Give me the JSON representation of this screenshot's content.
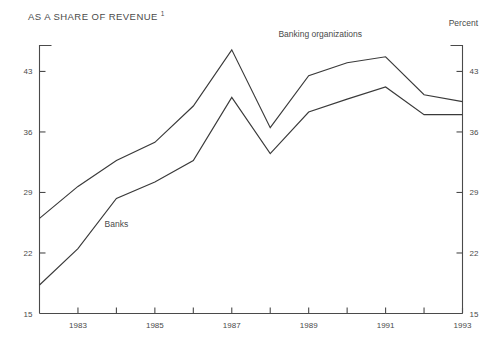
{
  "header": {
    "title": "AS A SHARE OF REVENUE",
    "title_footnote": "1",
    "unit_label": "Percent"
  },
  "chart_data": {
    "type": "line",
    "title": "AS A SHARE OF REVENUE",
    "subtitle": "",
    "xlabel": "",
    "ylabel": "Percent",
    "xlim": [
      1982,
      1993
    ],
    "ylim": [
      15,
      46
    ],
    "grid": false,
    "legend": "inline-annotations",
    "y_ticks": [
      15,
      22,
      29,
      36,
      43
    ],
    "x_ticks": [
      1982,
      1983,
      1984,
      1985,
      1986,
      1987,
      1988,
      1989,
      1990,
      1991,
      1992,
      1993
    ],
    "x_tick_labels": [
      "",
      "1983",
      "",
      "1985",
      "",
      "1987",
      "",
      "1989",
      "",
      "1991",
      "",
      "1993"
    ],
    "x": [
      1982,
      1983,
      1984,
      1985,
      1986,
      1987,
      1988,
      1989,
      1990,
      1991,
      1992,
      1993
    ],
    "series": [
      {
        "name": "Banking organizations",
        "values": [
          26.0,
          29.7,
          32.7,
          34.8,
          39.0,
          45.5,
          36.5,
          42.5,
          44.0,
          44.7,
          40.3,
          39.5
        ],
        "label_x": 1989.3,
        "label_y": 47.0
      },
      {
        "name": "Banks",
        "values": [
          18.3,
          22.5,
          28.3,
          30.2,
          32.7,
          40.0,
          33.5,
          38.3,
          39.8,
          41.2,
          38.0,
          38.0
        ],
        "label_x": 1984.0,
        "label_y": 25.0
      }
    ]
  }
}
